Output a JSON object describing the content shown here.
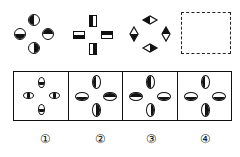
{
  "question": {
    "sequence": [
      {
        "id": "fig1",
        "shape": "circle",
        "parts": {
          "top": "left-black",
          "left": "bottom-black",
          "right": "top-black",
          "bottom": "right-black"
        }
      },
      {
        "id": "fig2",
        "shape": "rectangle",
        "parts": {
          "top": "left-black",
          "left": "bottom-black",
          "right": "top-black",
          "bottom": "right-black"
        }
      },
      {
        "id": "fig3",
        "shape": "diamond",
        "parts": {
          "top": "left-black",
          "left": "bottom-black",
          "right": "top-black",
          "bottom": "right-black"
        }
      },
      {
        "id": "blank",
        "shape": "dashed-box",
        "label": "?"
      }
    ]
  },
  "options": [
    {
      "label": "①",
      "shape": "small-oval",
      "parts": {
        "top": "bottom-black",
        "left": "left-black",
        "right": "right-black",
        "bottom": "bottom-black"
      }
    },
    {
      "label": "②",
      "shape": "ellipse",
      "parts": {
        "top": "left-black",
        "left": "bottom-black",
        "right": "top-black",
        "bottom": "right-black"
      }
    },
    {
      "label": "③",
      "shape": "ellipse",
      "parts": {
        "top": "left-black",
        "left": "top-black",
        "right": "bottom-black",
        "bottom": "right-black"
      }
    },
    {
      "label": "④",
      "shape": "ellipse",
      "parts": {
        "top": "left-black",
        "left": "bottom-black",
        "right": "bottom-black",
        "bottom": "right-black"
      }
    }
  ],
  "colors": {
    "ink": "#111111",
    "background": "#ffffff"
  }
}
